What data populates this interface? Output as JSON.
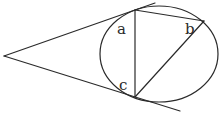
{
  "diagram": {
    "type": "geometry",
    "stroke_color": "#2a2a2a",
    "background": "#ffffff",
    "labels": {
      "a": "a",
      "b": "b",
      "c": "c"
    },
    "points": {
      "apex": [
        4,
        56
      ],
      "top_tangent": [
        135,
        10
      ],
      "bottom_tangent": [
        135,
        97
      ],
      "b_point": [
        204,
        21
      ]
    },
    "circle": {
      "cx": 159,
      "cy": 54,
      "rx": 59,
      "ry": 48
    }
  }
}
